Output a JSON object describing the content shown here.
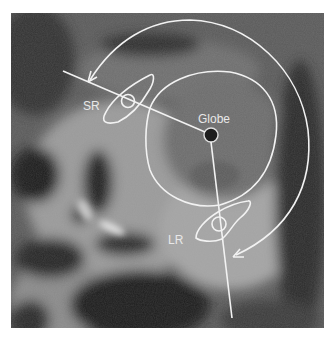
{
  "figure": {
    "type": "annotated coronal MRI of orbit",
    "labels": {
      "superior_rectus": "SR",
      "globe": "Globe",
      "lateral_rectus": "LR"
    },
    "annotation_color": "#f2f2f2",
    "background_tone": "grayscale"
  }
}
